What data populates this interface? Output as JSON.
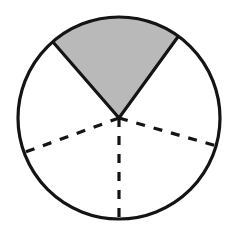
{
  "figure": {
    "type": "geometry-diagram",
    "canvas": {
      "width": 239,
      "height": 227,
      "background": "#ffffff"
    },
    "circle": {
      "center_x": 119,
      "center_y": 118,
      "radius": 101,
      "stroke_color": "#141414",
      "stroke_width": 3.2,
      "fill": "none"
    },
    "shaded_sector": {
      "label": "shaded sector",
      "start_angle_deg": 54,
      "end_angle_deg": 131,
      "sweep_deg": 77,
      "fill_color": "#b9b9b9",
      "stroke_color": "#141414",
      "stroke_width": 3.2
    },
    "radii": [
      {
        "name": "solid-radius-right",
        "angle_deg": 54,
        "style": "solid",
        "stroke_color": "#141414",
        "stroke_width": 3.2
      },
      {
        "name": "solid-radius-left",
        "angle_deg": 131,
        "style": "solid",
        "stroke_color": "#141414",
        "stroke_width": 3.2
      },
      {
        "name": "dashed-radius-upper-left",
        "angle_deg": 200,
        "style": "dashed",
        "stroke_color": "#141414",
        "stroke_width": 3.2,
        "dash_pattern": "9 9"
      },
      {
        "name": "dashed-radius-down",
        "angle_deg": 270,
        "style": "dashed",
        "stroke_color": "#141414",
        "stroke_width": 3.2,
        "dash_pattern": "9 9"
      },
      {
        "name": "dashed-radius-lower-right",
        "angle_deg": 344,
        "style": "dashed",
        "stroke_color": "#141414",
        "stroke_width": 3.2,
        "dash_pattern": "9 9"
      }
    ],
    "sector_count": 5,
    "shaded_count": 1
  },
  "chart_data": {
    "type": "pie",
    "categories": [
      "shaded sector",
      "sector 2",
      "sector 3",
      "sector 4",
      "sector 5"
    ],
    "values": [
      77,
      69,
      74,
      70,
      70
    ],
    "units": "degrees",
    "colors": [
      "#b9b9b9",
      "#ffffff",
      "#ffffff",
      "#ffffff",
      "#ffffff"
    ],
    "boundary_angles_deg": [
      54,
      131,
      200,
      270,
      344
    ],
    "grid": false,
    "legend": false,
    "xlabel": "",
    "ylabel": ""
  }
}
